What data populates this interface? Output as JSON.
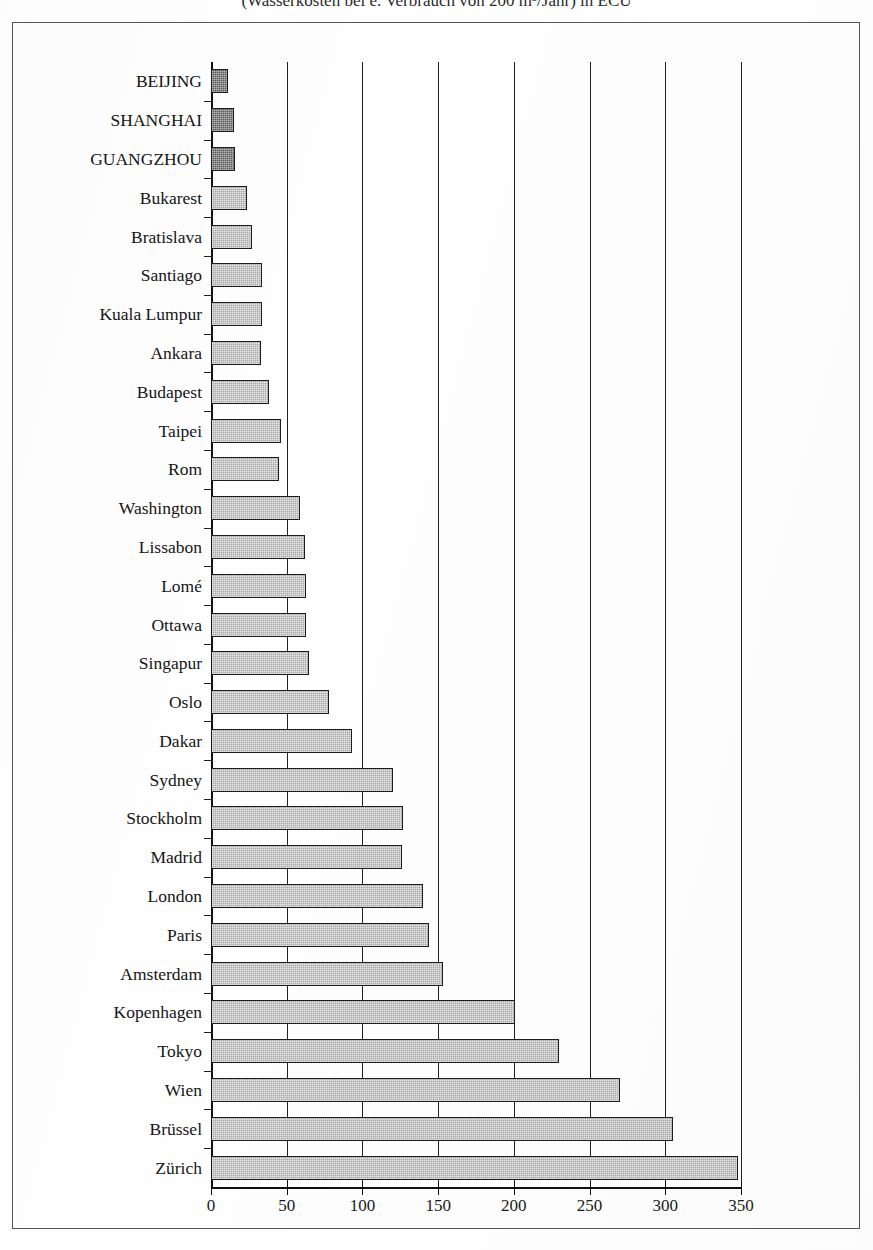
{
  "figure": {
    "title_partial": "(Wasserkosten bei e. Verbrauch von 200 m³/Jahr) in ECU",
    "frame_visible": true
  },
  "chart_data": {
    "type": "bar",
    "orientation": "horizontal",
    "title": "(Wasserkosten bei e. Verbrauch von 200 m³/Jahr) in ECU",
    "xlabel": "",
    "ylabel": "",
    "xlim": [
      0,
      350
    ],
    "ylim": null,
    "grid": true,
    "legend": null,
    "xticks": [
      0,
      50,
      100,
      150,
      200,
      250,
      300,
      350
    ],
    "xtick_labels": [
      "0",
      "50",
      "100",
      "150",
      "200",
      "250",
      "300",
      "350"
    ],
    "categories": [
      "BEIJING",
      "SHANGHAI",
      "GUANGZHOU",
      "Bukarest",
      "Bratislava",
      "Santiago",
      "Kuala Lumpur",
      "Ankara",
      "Budapest",
      "Taipei",
      "Rom",
      "Washington",
      "Lissabon",
      "Lomé",
      "Ottawa",
      "Singapur",
      "Oslo",
      "Dakar",
      "Sydney",
      "Stockholm",
      "Madrid",
      "London",
      "Paris",
      "Amsterdam",
      "Kopenhagen",
      "Tokyo",
      "Wien",
      "Brüssel",
      "Zürich"
    ],
    "values": [
      11,
      15,
      16,
      24,
      27,
      34,
      34,
      33,
      38,
      46,
      45,
      59,
      62,
      63,
      63,
      65,
      78,
      93,
      120,
      127,
      126,
      140,
      144,
      153,
      201,
      230,
      270,
      305,
      348
    ],
    "bar_styles": [
      "dark",
      "dark",
      "dark",
      "light",
      "light",
      "light",
      "light",
      "light",
      "light",
      "light",
      "light",
      "light",
      "light",
      "light",
      "light",
      "light",
      "light",
      "light",
      "light",
      "light",
      "light",
      "light",
      "light",
      "light",
      "light",
      "light",
      "light",
      "light",
      "light"
    ],
    "colors": {
      "bar_light": "#a8a8a8",
      "bar_dark": "#5d5d5d",
      "bar_outline": "#1d1d1d",
      "axis": "#111111",
      "gridline": "#202020",
      "background": "#ffffff",
      "text": "#151515"
    }
  }
}
